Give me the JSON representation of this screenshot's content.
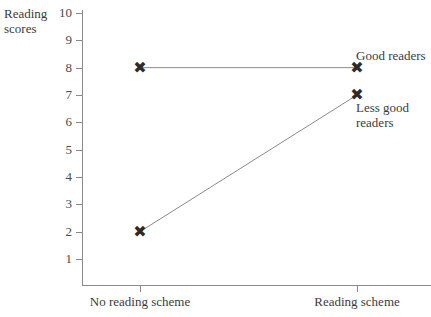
{
  "chart_data": {
    "type": "line",
    "title": "",
    "xlabel": "",
    "ylabel": "Reading\nscores",
    "categories": [
      "No reading scheme",
      "Reading scheme"
    ],
    "series": [
      {
        "name": "Good readers",
        "values": [
          8,
          8
        ]
      },
      {
        "name": "Less good readers",
        "values": [
          2,
          7
        ]
      }
    ],
    "ylim": [
      0,
      10
    ],
    "yticks": [
      10,
      9,
      8,
      7,
      6,
      5,
      4,
      3,
      2,
      1
    ],
    "ytick_labels": [
      "10",
      "9",
      "8",
      "7",
      "6",
      "5",
      "4",
      "3",
      "2",
      "1"
    ],
    "grid": false,
    "legend": "inline-right-of-points",
    "marker": "x",
    "marker_color": "#2b2b2b",
    "line_color": "#8a8a8a",
    "axis_color": "#8a8a8a",
    "background": "#ffffff"
  },
  "axes": {
    "y_title": "Reading\nscores",
    "x_categories": [
      {
        "label": "No reading scheme"
      },
      {
        "label": "Reading scheme"
      }
    ],
    "y_ticks": [
      {
        "label": "10"
      },
      {
        "label": "9"
      },
      {
        "label": "8"
      },
      {
        "label": "7"
      },
      {
        "label": "6"
      },
      {
        "label": "5"
      },
      {
        "label": "4"
      },
      {
        "label": "3"
      },
      {
        "label": "2"
      },
      {
        "label": "1"
      }
    ]
  },
  "series_labels": {
    "good": "Good readers",
    "less_good": "Less good\nreaders"
  },
  "markers": {
    "glyph": "✖"
  }
}
